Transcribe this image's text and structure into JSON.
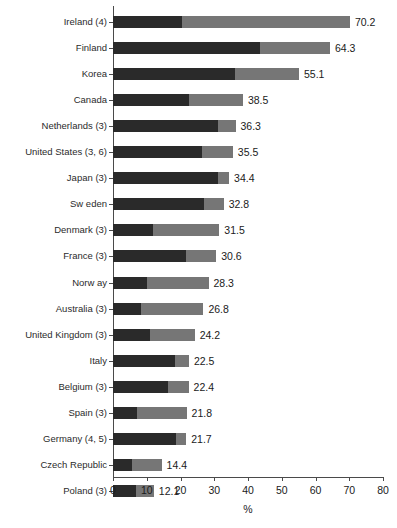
{
  "chart_data": {
    "type": "bar",
    "orientation": "horizontal",
    "stacked": true,
    "title": "",
    "xlabel": "%",
    "ylabel": "",
    "xlim": [
      0,
      80
    ],
    "xticks": [
      0,
      10,
      20,
      30,
      40,
      50,
      60,
      70,
      80
    ],
    "grid": false,
    "legend": null,
    "colors": {
      "segment_dark": "#2a2a2a",
      "segment_light": "#767676",
      "axis": "#4a4a4a",
      "text": "#1a1a1a",
      "background": "#ffffff"
    },
    "categories": [
      "Ireland (4)",
      "Finland",
      "Korea",
      "Canada",
      "Netherlands (3)",
      "United States (3, 6)",
      "Japan (3)",
      "Sw eden",
      "Denmark (3)",
      "France (3)",
      "Norw ay",
      "Australia (3)",
      "United Kingdom (3)",
      "Italy",
      "Belgium (3)",
      "Spain (3)",
      "Germany (4, 5)",
      "Czech Republic",
      "Poland (3)"
    ],
    "series": [
      {
        "name": "segment-dark",
        "values": [
          20.4,
          43.7,
          36.2,
          22.4,
          31.1,
          26.4,
          31.0,
          26.9,
          11.9,
          21.5,
          10.1,
          8.2,
          11.1,
          18.5,
          16.4,
          7.0,
          18.6,
          5.6,
          6.8
        ]
      },
      {
        "name": "segment-light",
        "values": [
          49.8,
          20.6,
          18.9,
          16.1,
          5.2,
          9.1,
          3.4,
          5.9,
          19.6,
          9.1,
          18.2,
          18.6,
          13.1,
          4.0,
          6.0,
          14.8,
          3.1,
          8.8,
          5.3
        ]
      }
    ],
    "totals": [
      70.2,
      64.3,
      55.1,
      38.5,
      36.3,
      35.5,
      34.4,
      32.8,
      31.5,
      30.6,
      28.3,
      26.8,
      24.2,
      22.5,
      22.4,
      21.8,
      21.7,
      14.4,
      12.1
    ],
    "value_labels": [
      "70.2",
      "64.3",
      "55.1",
      "38.5",
      "36.3",
      "35.5",
      "34.4",
      "32.8",
      "31.5",
      "30.6",
      "28.3",
      "26.8",
      "24.2",
      "22.5",
      "22.4",
      "21.8",
      "21.7",
      "14.4",
      "12.1"
    ],
    "xtick_labels": [
      "0",
      "10",
      "20",
      "30",
      "40",
      "50",
      "60",
      "70",
      "80"
    ]
  }
}
